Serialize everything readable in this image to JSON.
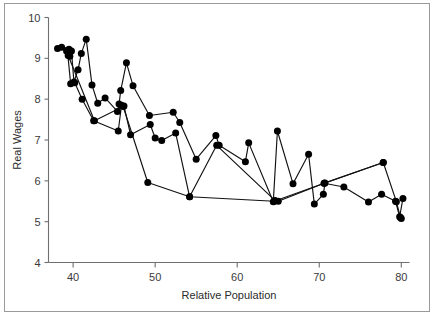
{
  "figure": {
    "background_color": "#ffffff",
    "border_color": "#9a9a9a",
    "marker_color": "#000000",
    "line_color": "#111111"
  },
  "axes": {
    "x_title": "Relative Population",
    "y_title": "Real Wages",
    "x_ticks": [
      "40",
      "50",
      "60",
      "70",
      "80"
    ],
    "y_ticks": [
      "10",
      "9",
      "8",
      "7",
      "6",
      "5",
      "4"
    ]
  },
  "chart_data": {
    "type": "line",
    "title": "",
    "subtitle": "",
    "xlabel": "Relative Population",
    "ylabel": "Real Wages",
    "xlim": [
      37.0,
      81.0
    ],
    "ylim": [
      4,
      10
    ],
    "xticks": [
      40,
      50,
      60,
      70,
      80
    ],
    "yticks": [
      4,
      5,
      6,
      7,
      8,
      9,
      10
    ],
    "grid": false,
    "legend": "none",
    "marker": "filled-circle",
    "annotations": [],
    "series": [
      {
        "name": "trajectory-a",
        "points": [
          [
            38.1,
            9.24
          ],
          [
            38.6,
            9.27
          ],
          [
            39.2,
            9.18
          ],
          [
            39.5,
            9.22
          ],
          [
            39.6,
            9.05
          ],
          [
            39.8,
            9.18
          ],
          [
            40.1,
            8.42
          ],
          [
            40.6,
            8.72
          ],
          [
            41.0,
            9.12
          ],
          [
            41.6,
            9.47
          ],
          [
            42.3,
            8.35
          ],
          [
            43.0,
            7.9
          ],
          [
            43.9,
            8.03
          ],
          [
            45.4,
            7.7
          ],
          [
            45.6,
            7.88
          ],
          [
            45.8,
            8.21
          ],
          [
            46.5,
            8.89
          ],
          [
            47.3,
            8.33
          ],
          [
            49.3,
            7.6
          ],
          [
            52.2,
            7.68
          ],
          [
            53.0,
            7.43
          ],
          [
            55.0,
            6.53
          ],
          [
            57.4,
            7.11
          ],
          [
            57.8,
            6.87
          ],
          [
            61.0,
            6.47
          ],
          [
            61.4,
            6.93
          ],
          [
            64.4,
            5.49
          ],
          [
            64.9,
            7.22
          ],
          [
            66.8,
            5.93
          ],
          [
            68.7,
            6.65
          ],
          [
            69.4,
            5.43
          ],
          [
            70.5,
            5.67
          ],
          [
            70.7,
            5.95
          ],
          [
            77.8,
            6.45
          ],
          [
            79.4,
            5.49
          ],
          [
            79.9,
            5.1
          ],
          [
            80.0,
            5.08
          ]
        ]
      },
      {
        "name": "trajectory-b",
        "points": [
          [
            39.3,
            9.2
          ],
          [
            39.7,
            8.38
          ],
          [
            40.2,
            8.4
          ],
          [
            41.1,
            8.0
          ],
          [
            42.5,
            7.47
          ],
          [
            45.5,
            7.22
          ],
          [
            45.9,
            7.85
          ],
          [
            46.2,
            7.83
          ],
          [
            47.0,
            7.13
          ],
          [
            49.4,
            7.38
          ],
          [
            50.0,
            7.05
          ],
          [
            50.8,
            6.99
          ],
          [
            52.5,
            7.17
          ],
          [
            54.2,
            5.61
          ],
          [
            57.5,
            6.87
          ],
          [
            64.6,
            5.52
          ],
          [
            65.0,
            5.5
          ],
          [
            70.6,
            5.94
          ],
          [
            73.0,
            5.85
          ],
          [
            76.0,
            5.48
          ],
          [
            77.6,
            5.67
          ],
          [
            79.3,
            5.5
          ],
          [
            79.8,
            5.12
          ],
          [
            80.2,
            5.57
          ]
        ]
      },
      {
        "name": "trajectory-c",
        "points": [
          [
            39.4,
            9.07
          ],
          [
            42.6,
            7.47
          ],
          [
            46.1,
            7.82
          ],
          [
            49.1,
            5.96
          ],
          [
            54.2,
            5.61
          ],
          [
            64.5,
            5.5
          ],
          [
            70.6,
            5.94
          ],
          [
            77.8,
            6.45
          ]
        ]
      }
    ]
  }
}
